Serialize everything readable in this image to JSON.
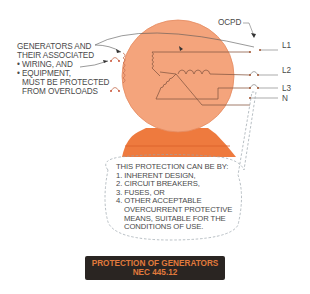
{
  "diagram": {
    "left_label_lines": [
      "GENERATORS AND",
      "THEIR ASSOCIATED",
      "• WIRING, AND",
      "• EQUIPMENT,",
      "MUST BE PROTECTED",
      "FROM OVERLOADS"
    ],
    "ocpd_label": "OCPD",
    "lines": {
      "l1": "L1",
      "l2": "L2",
      "l3": "L3",
      "n": "N"
    },
    "protection_lines": [
      "THIS PROTECTION CAN BE BY:",
      "1. INHERENT DESIGN,",
      "2. CIRCUIT BREAKERS,",
      "3. FUSES, OR",
      "4. OTHER ACCEPTABLE",
      "OVERCURRENT PROTECTIVE",
      "MEANS, SUITABLE FOR THE",
      "CONDITIONS OF USE."
    ],
    "banner": {
      "title": "PROTECTION OF GENERATORS",
      "code": "NEC 445.12"
    },
    "colors": {
      "generator_body": "#f4a47c",
      "generator_base": "#ee7a3e",
      "wire": "#8a5a44",
      "text": "#4a4a4a",
      "banner_bg": "#2a2522",
      "banner_text": "#e07a3c"
    }
  }
}
